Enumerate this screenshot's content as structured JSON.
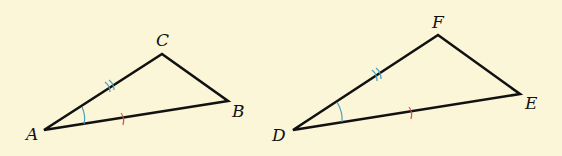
{
  "colors": {
    "background": "#fbf6d8",
    "line": "#111111",
    "angle_mark": "#4a9fc0",
    "tick_mark": "#d9534f"
  },
  "triangles": [
    {
      "vertices": {
        "A": [
          44,
          130
        ],
        "B": [
          228,
          101
        ],
        "C": [
          162,
          54
        ]
      },
      "labels": {
        "A": "A",
        "B": "B",
        "C": "C"
      }
    },
    {
      "vertices": {
        "D": [
          293,
          130
        ],
        "E": [
          520,
          94
        ],
        "F": [
          438,
          35
        ]
      },
      "labels": {
        "D": "D",
        "E": "E",
        "F": "F"
      }
    }
  ]
}
